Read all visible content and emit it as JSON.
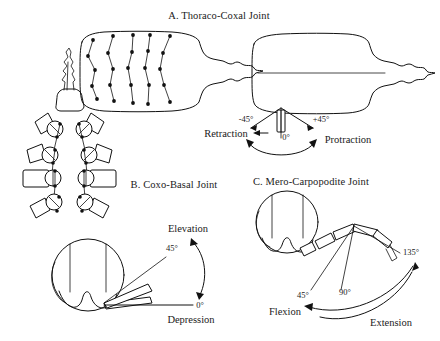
{
  "figure": {
    "name": "crustacean-leg-joint-range-of-motion-diagram",
    "background_color": "#ffffff",
    "ink_color": "#111111"
  },
  "panels": [
    {
      "id": "A",
      "title": "A. Thoraco-Coxal Joint",
      "views": [
        {
          "name": "dorsal-view-leg-trajectories",
          "description": "dorsal carapace outline with four pairs of limb attachment point chains"
        },
        {
          "name": "dorsal-view-angle-reference",
          "description": "dorsal carapace outline with midline and single coxa segment"
        }
      ],
      "angles": [
        "-45°",
        "0°",
        "+45°"
      ],
      "directions": [
        "Retraction",
        "Protraction"
      ],
      "arrow": "double-headed-arc"
    },
    {
      "id": "B",
      "title": "B. Coxo-Basal Joint",
      "views": [
        {
          "name": "ventral-view-coxa-array",
          "description": "ventral thorax with four pairs of coxo-basal joints"
        },
        {
          "name": "cross-section-elevation",
          "description": "transverse body section with limb at two elevations"
        }
      ],
      "angles": [
        "45°",
        "0°"
      ],
      "directions": [
        "Elevation",
        "Depression"
      ],
      "arrow": "double-headed-arc"
    },
    {
      "id": "C",
      "title": "C. Mero-Carpopodite Joint",
      "views": [
        {
          "name": "cross-section-flexion",
          "description": "transverse body section with limb at three flexion angles"
        }
      ],
      "angles": [
        "45°",
        "90°",
        "135°"
      ],
      "directions": [
        "Flexion",
        "Extension"
      ],
      "arrow": "double-headed-arc"
    }
  ],
  "labels": {
    "title_a": "A. Thoraco-Coxal Joint",
    "title_b": "B. Coxo-Basal Joint",
    "title_c": "C. Mero-Carpopodite Joint",
    "a_minus45": "-45°",
    "a_zero": "0°",
    "a_plus45": "+45°",
    "a_retraction": "Retraction",
    "a_protraction": "Protraction",
    "b_elevation": "Elevation",
    "b_45": "45°",
    "b_zero": "0°",
    "b_depression": "Depression",
    "c_45": "45°",
    "c_90": "90°",
    "c_135": "135°",
    "c_flexion": "Flexion",
    "c_extension": "Extension"
  }
}
